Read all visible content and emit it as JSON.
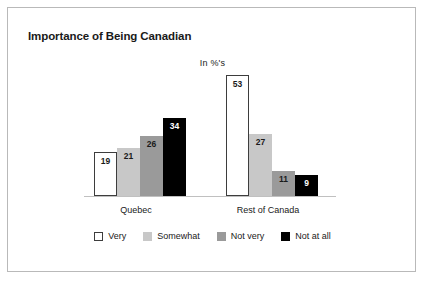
{
  "card": {
    "title": "Importance of Being Canadian",
    "subtitle": "In %'s"
  },
  "chart_data": {
    "type": "bar",
    "title": "Importance of Being Canadian",
    "subtitle": "In %'s",
    "xlabel": "",
    "ylabel": "",
    "ylim": [
      0,
      55
    ],
    "grid": false,
    "legend_position": "bottom",
    "value_labels": true,
    "categories": [
      "Quebec",
      "Rest of Canada"
    ],
    "series": [
      {
        "name": "Very",
        "color": "#ffffff",
        "values": [
          19,
          21
        ]
      },
      {
        "name": "Somewhat",
        "color": "#c8c8c8",
        "values": [
          21,
          27
        ]
      },
      {
        "name": "Not very",
        "color": "#9a9a9a",
        "values": [
          26,
          11
        ]
      },
      {
        "name": "Not at all",
        "color": "#000000",
        "values": [
          34,
          9
        ]
      }
    ],
    "groups": [
      {
        "category": "Quebec",
        "bars": [
          {
            "series": "Very",
            "value": 19,
            "label": "19",
            "style": "swatch-very"
          },
          {
            "series": "Somewhat",
            "value": 21,
            "label": "21",
            "style": "swatch-somewhat"
          },
          {
            "series": "Not very",
            "value": 26,
            "label": "26",
            "style": "swatch-notvery"
          },
          {
            "series": "Not at all",
            "value": 34,
            "label": "34",
            "style": "swatch-notatall"
          }
        ]
      },
      {
        "category": "Rest of Canada",
        "bars": [
          {
            "series": "Very",
            "value": 53,
            "label": "53",
            "style": "swatch-very"
          },
          {
            "series": "Somewhat",
            "value": 27,
            "label": "27",
            "style": "swatch-somewhat"
          },
          {
            "series": "Not very",
            "value": 11,
            "label": "11",
            "style": "swatch-notvery"
          },
          {
            "series": "Not at all",
            "value": 9,
            "label": "9",
            "style": "swatch-notatall"
          }
        ]
      }
    ]
  },
  "legend": {
    "items": [
      {
        "label": "Very",
        "style": "swatch-very"
      },
      {
        "label": "Somewhat",
        "style": "swatch-somewhat"
      },
      {
        "label": "Not very",
        "style": "swatch-notvery"
      },
      {
        "label": "Not at all",
        "style": "swatch-notatall"
      }
    ]
  }
}
